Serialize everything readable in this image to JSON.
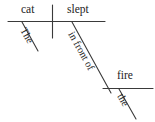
{
  "diagram": {
    "type": "reed-kellogg-sentence-diagram",
    "sentence": "The cat slept in front of the fire.",
    "colors": {
      "background": "#ffffff",
      "ink": "#232323",
      "line": "#3a3a3a"
    },
    "nodes": {
      "subject": "cat",
      "verb": "slept",
      "subject_article": "The",
      "preposition": "in front of",
      "object": "fire",
      "object_article": "the"
    },
    "lines": [
      {
        "name": "main-baseline",
        "x1": 8,
        "y1": 21.5,
        "x2": 105,
        "y2": 21.5
      },
      {
        "name": "subject-verb-divider",
        "x1": 52.5,
        "y1": 5,
        "x2": 52.5,
        "y2": 38
      },
      {
        "name": "subject-article-slant",
        "x1": 22,
        "y1": 22,
        "x2": 38,
        "y2": 51
      },
      {
        "name": "preposition-slant",
        "x1": 72,
        "y1": 22,
        "x2": 111,
        "y2": 93
      },
      {
        "name": "object-baseline",
        "x1": 103,
        "y1": 88.5,
        "x2": 153,
        "y2": 88.5
      },
      {
        "name": "object-article-slant",
        "x1": 119,
        "y1": 89,
        "x2": 136,
        "y2": 119
      }
    ]
  }
}
